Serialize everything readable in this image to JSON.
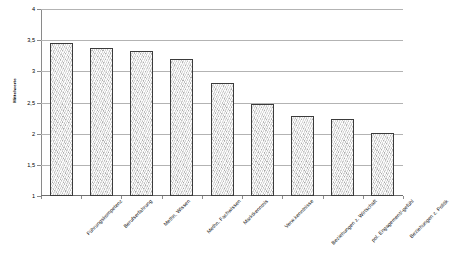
{
  "chart_data": {
    "type": "bar",
    "title": "",
    "subtitle": "",
    "xlabel": "",
    "ylabel": "Mittelwerte",
    "ylim": [
      1,
      4
    ],
    "ytick_labels": [
      "4",
      "3,5",
      "3",
      "2,5",
      "2",
      "1,5",
      "1"
    ],
    "yticks": [
      4,
      3.5,
      3,
      2.5,
      2,
      1.5,
      1
    ],
    "grid": true,
    "legend": false,
    "legend_position": "none",
    "categories": [
      "Führungskompetenz",
      "Berufserfahrung",
      "Methn. Wissen",
      "Methn. Fachwissen",
      "Marktkenntnis",
      "Verw.kenntnisse",
      "Beziehungen z. Wirtschaft",
      "pol. Engagement/-gefühl",
      "Beziehungen z. Politik"
    ],
    "values": [
      3.45,
      3.37,
      3.33,
      3.2,
      2.82,
      2.48,
      2.28,
      2.23,
      2.01
    ],
    "bar_fill_color": "#d8d8d8",
    "bar_border_color": "#3b3b3b",
    "gridline_color": "#b3b3b3",
    "axis_color": "#8a8a8a",
    "background_color": "#ffffff"
  }
}
